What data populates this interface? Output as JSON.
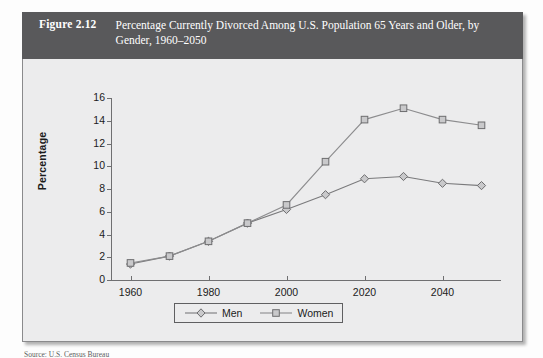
{
  "figure": {
    "number": "Figure 2.12",
    "title": "Percentage Currently Divorced Among U.S. Population 65 Years and Older, by Gender, 1960–2050",
    "source_fragment": "Source: U.S. Census Bureau"
  },
  "colors": {
    "header_band": "#59595b",
    "header_text": "#ffffff",
    "panel_background": "#ececed",
    "panel_border": "#8a8a8c",
    "axis": "#6f6f71",
    "series_men": "#7a7a7c",
    "series_women": "#8c8c8e",
    "marker_fill": "#c9c9cb",
    "text": "#1b1b1b"
  },
  "chart_data": {
    "type": "line",
    "title": "Percentage Currently Divorced Among U.S. Population 65 Years and Older, by Gender, 1960–2050",
    "xlabel": "",
    "ylabel": "Percentage",
    "x": [
      1960,
      1970,
      1980,
      1990,
      2000,
      2010,
      2020,
      2030,
      2040,
      2050
    ],
    "xlim": [
      1955,
      2055
    ],
    "ylim": [
      0,
      16
    ],
    "xticks": [
      1960,
      1980,
      2000,
      2020,
      2040
    ],
    "xtick_labels": [
      "1960",
      "1980",
      "2000",
      "2020",
      "2040"
    ],
    "yticks": [
      0,
      2,
      4,
      6,
      8,
      10,
      12,
      14,
      16
    ],
    "ytick_labels": [
      "0",
      "2",
      "4",
      "6",
      "8",
      "10",
      "12",
      "14",
      "16"
    ],
    "grid": false,
    "legend_position": "bottom-center",
    "series": [
      {
        "name": "Men",
        "marker": "diamond",
        "values": [
          1.4,
          2.1,
          3.4,
          5.0,
          6.2,
          7.5,
          8.9,
          9.1,
          8.5,
          8.3
        ]
      },
      {
        "name": "Women",
        "marker": "square",
        "values": [
          1.5,
          2.1,
          3.4,
          5.0,
          6.6,
          10.4,
          14.1,
          15.1,
          14.1,
          13.6
        ]
      }
    ]
  },
  "legend": {
    "entries": [
      {
        "label": "Men"
      },
      {
        "label": "Women"
      }
    ]
  }
}
